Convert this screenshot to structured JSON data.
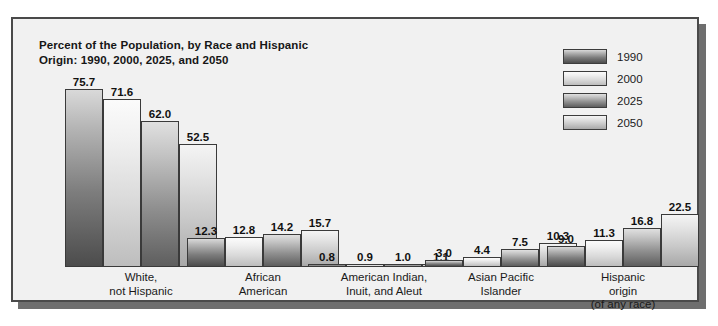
{
  "chart_data": {
    "type": "bar",
    "title": "Percent of the Population, by Race and Hispanic\nOrigin: 1990, 2000, 2025, and 2050",
    "xlabel": "",
    "ylabel": "",
    "ylim": [
      0,
      80
    ],
    "grid": false,
    "legend_position": "top-right",
    "categories": [
      "White,\nnot Hispanic",
      "African\nAmerican",
      "American Indian,\nInuit, and Aleut",
      "Asian Pacific\nIslander",
      "Hispanic\norigin\n(of any race)"
    ],
    "series": [
      {
        "name": "1990",
        "values": [
          75.7,
          12.3,
          0.8,
          3.0,
          9.0
        ],
        "color": "#4c4c4c"
      },
      {
        "name": "2000",
        "values": [
          71.6,
          12.8,
          0.9,
          4.4,
          11.3
        ],
        "color": "#e0e0e0"
      },
      {
        "name": "2025",
        "values": [
          62.0,
          14.2,
          1.0,
          7.5,
          16.8
        ],
        "color": "#6e6e6e"
      },
      {
        "name": "2050",
        "values": [
          52.5,
          15.7,
          1.1,
          10.3,
          22.5
        ],
        "color": "#c8c8c8"
      }
    ],
    "value_labels": [
      [
        "75.7",
        "71.6",
        "62.0",
        "52.5"
      ],
      [
        "12.3",
        "12.8",
        "14.2",
        "15.7"
      ],
      [
        "0.8",
        "0.9",
        "1.0",
        "1.1"
      ],
      [
        "3.0",
        "4.4",
        "7.5",
        "10.3"
      ],
      [
        "9.0",
        "11.3",
        "16.8",
        "22.5"
      ]
    ]
  },
  "legend": {
    "items": [
      {
        "label": "1990"
      },
      {
        "label": "2000"
      },
      {
        "label": "2025"
      },
      {
        "label": "2050"
      }
    ]
  }
}
